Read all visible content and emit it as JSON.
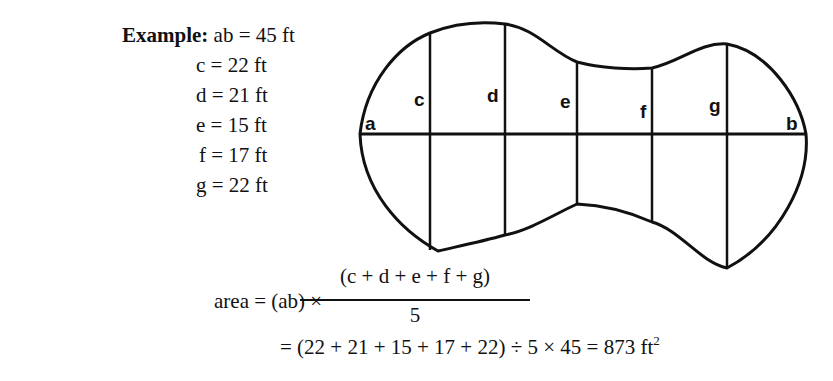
{
  "example": {
    "title": "Example:",
    "ab": "ab = 45 ft",
    "rows": [
      {
        "name": "c",
        "text": "c = 22 ft"
      },
      {
        "name": "d",
        "text": "d = 21 ft"
      },
      {
        "name": "e",
        "text": "e = 15 ft"
      },
      {
        "name": "f",
        "text": "f = 17 ft"
      },
      {
        "name": "g",
        "text": "g = 22 ft"
      }
    ]
  },
  "diagram": {
    "labels": {
      "a": "a",
      "b": "b",
      "c": "c",
      "d": "d",
      "e": "e",
      "f": "f",
      "g": "g"
    }
  },
  "formula": {
    "lhs": "area = (ab) ×",
    "numerator": "(c + d + e + f + g)",
    "denominator": "5",
    "line2": "= (22 + 21 + 15 + 17 + 22) ÷ 5 × 45 = 873 ft",
    "unit_exponent": "2"
  }
}
